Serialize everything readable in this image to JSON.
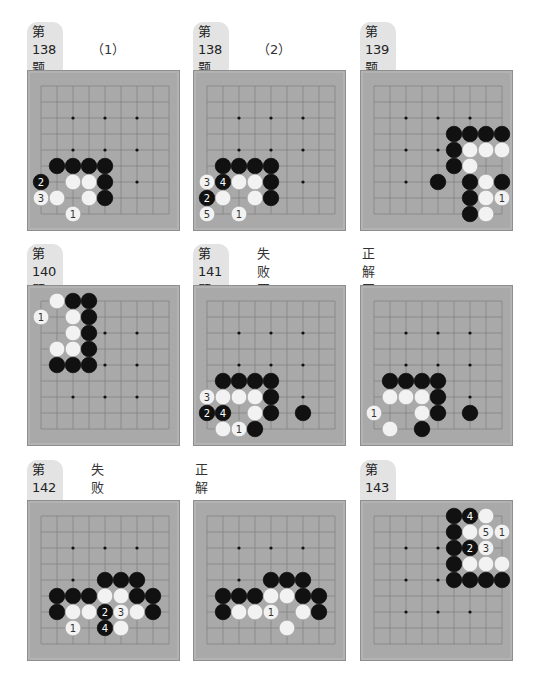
{
  "colors": {
    "board": "#a9a9a9",
    "grid_line": "#7a7a7a",
    "black_stone": "#111111",
    "white_stone": "#f2f2f2",
    "label_pill": "#e3e3e3"
  },
  "grid": {
    "size": 9,
    "spacing": 16,
    "origin_x": 13,
    "origin_y": 15
  },
  "problems": [
    {
      "id": "p138-1",
      "label": "第138题",
      "sub_label": "（1）",
      "pos": {
        "x": 27,
        "y": 40,
        "board_y": 70
      },
      "stars": [
        [
          2,
          2
        ],
        [
          4,
          2
        ],
        [
          6,
          2
        ],
        [
          2,
          4
        ],
        [
          4,
          4
        ],
        [
          6,
          4
        ],
        [
          6,
          6
        ]
      ],
      "stones": [
        {
          "c": "B",
          "x": 1,
          "y": 5
        },
        {
          "c": "B",
          "x": 2,
          "y": 5
        },
        {
          "c": "B",
          "x": 3,
          "y": 5
        },
        {
          "c": "B",
          "x": 4,
          "y": 5
        },
        {
          "c": "B",
          "x": 0,
          "y": 6,
          "n": "2"
        },
        {
          "c": "W",
          "x": 2,
          "y": 6
        },
        {
          "c": "W",
          "x": 3,
          "y": 6
        },
        {
          "c": "B",
          "x": 4,
          "y": 6
        },
        {
          "c": "W",
          "x": 0,
          "y": 7,
          "n": "3"
        },
        {
          "c": "W",
          "x": 1,
          "y": 7
        },
        {
          "c": "W",
          "x": 3,
          "y": 7
        },
        {
          "c": "B",
          "x": 4,
          "y": 7
        },
        {
          "c": "W",
          "x": 2,
          "y": 8,
          "n": "1"
        }
      ]
    },
    {
      "id": "p138-2",
      "label": "第138题",
      "sub_label": "（2）",
      "pos": {
        "x": 193,
        "y": 40,
        "board_y": 70
      },
      "stars": [
        [
          2,
          2
        ],
        [
          4,
          2
        ],
        [
          6,
          2
        ],
        [
          2,
          4
        ],
        [
          4,
          4
        ],
        [
          6,
          4
        ],
        [
          6,
          6
        ]
      ],
      "stones": [
        {
          "c": "B",
          "x": 1,
          "y": 5
        },
        {
          "c": "B",
          "x": 2,
          "y": 5
        },
        {
          "c": "B",
          "x": 3,
          "y": 5
        },
        {
          "c": "B",
          "x": 4,
          "y": 5
        },
        {
          "c": "W",
          "x": 0,
          "y": 6,
          "n": "3"
        },
        {
          "c": "B",
          "x": 1,
          "y": 6,
          "n": "4"
        },
        {
          "c": "W",
          "x": 2,
          "y": 6
        },
        {
          "c": "W",
          "x": 3,
          "y": 6
        },
        {
          "c": "B",
          "x": 4,
          "y": 6
        },
        {
          "c": "B",
          "x": 0,
          "y": 7,
          "n": "2"
        },
        {
          "c": "W",
          "x": 1,
          "y": 7
        },
        {
          "c": "W",
          "x": 3,
          "y": 7
        },
        {
          "c": "B",
          "x": 4,
          "y": 7
        },
        {
          "c": "W",
          "x": 0,
          "y": 8,
          "n": "5"
        },
        {
          "c": "W",
          "x": 2,
          "y": 8,
          "n": "1"
        }
      ]
    },
    {
      "id": "p139",
      "label": "第139题",
      "sub_label": "",
      "pos": {
        "x": 360,
        "y": 40,
        "board_y": 70
      },
      "stars": [
        [
          2,
          2
        ],
        [
          4,
          2
        ],
        [
          6,
          2
        ],
        [
          2,
          4
        ],
        [
          4,
          4
        ],
        [
          2,
          6
        ]
      ],
      "stones": [
        {
          "c": "B",
          "x": 5,
          "y": 3
        },
        {
          "c": "B",
          "x": 6,
          "y": 3
        },
        {
          "c": "B",
          "x": 7,
          "y": 3
        },
        {
          "c": "B",
          "x": 8,
          "y": 3
        },
        {
          "c": "B",
          "x": 5,
          "y": 4
        },
        {
          "c": "W",
          "x": 6,
          "y": 4
        },
        {
          "c": "W",
          "x": 7,
          "y": 4
        },
        {
          "c": "W",
          "x": 8,
          "y": 4
        },
        {
          "c": "B",
          "x": 5,
          "y": 5
        },
        {
          "c": "W",
          "x": 6,
          "y": 5
        },
        {
          "c": "B",
          "x": 4,
          "y": 6
        },
        {
          "c": "B",
          "x": 6,
          "y": 6
        },
        {
          "c": "W",
          "x": 7,
          "y": 6
        },
        {
          "c": "B",
          "x": 8,
          "y": 6
        },
        {
          "c": "B",
          "x": 6,
          "y": 7
        },
        {
          "c": "W",
          "x": 7,
          "y": 7
        },
        {
          "c": "W",
          "x": 8,
          "y": 7,
          "n": "1"
        },
        {
          "c": "B",
          "x": 6,
          "y": 8
        },
        {
          "c": "W",
          "x": 7,
          "y": 8
        }
      ]
    },
    {
      "id": "p140",
      "label": "第140题",
      "sub_label": "",
      "pos": {
        "x": 27,
        "y": 262,
        "board_y": 285
      },
      "stars": [
        [
          4,
          2
        ],
        [
          6,
          2
        ],
        [
          4,
          4
        ],
        [
          6,
          4
        ],
        [
          2,
          6
        ],
        [
          4,
          6
        ],
        [
          6,
          6
        ]
      ],
      "stones": [
        {
          "c": "W",
          "x": 1,
          "y": 0
        },
        {
          "c": "B",
          "x": 2,
          "y": 0
        },
        {
          "c": "B",
          "x": 3,
          "y": 0
        },
        {
          "c": "W",
          "x": 0,
          "y": 1,
          "n": "1"
        },
        {
          "c": "W",
          "x": 2,
          "y": 1
        },
        {
          "c": "B",
          "x": 3,
          "y": 1
        },
        {
          "c": "W",
          "x": 2,
          "y": 2
        },
        {
          "c": "B",
          "x": 3,
          "y": 2
        },
        {
          "c": "W",
          "x": 1,
          "y": 3
        },
        {
          "c": "W",
          "x": 2,
          "y": 3
        },
        {
          "c": "B",
          "x": 3,
          "y": 3
        },
        {
          "c": "B",
          "x": 1,
          "y": 4
        },
        {
          "c": "B",
          "x": 2,
          "y": 4
        },
        {
          "c": "B",
          "x": 3,
          "y": 4
        }
      ]
    },
    {
      "id": "p141-fail",
      "label": "第141题",
      "sub_label": "失败图",
      "pos": {
        "x": 193,
        "y": 262,
        "board_y": 285
      },
      "stars": [
        [
          2,
          2
        ],
        [
          4,
          2
        ],
        [
          6,
          2
        ],
        [
          2,
          4
        ],
        [
          4,
          4
        ],
        [
          6,
          4
        ],
        [
          6,
          6
        ]
      ],
      "stones": [
        {
          "c": "B",
          "x": 1,
          "y": 5
        },
        {
          "c": "B",
          "x": 2,
          "y": 5
        },
        {
          "c": "B",
          "x": 3,
          "y": 5
        },
        {
          "c": "B",
          "x": 4,
          "y": 5
        },
        {
          "c": "W",
          "x": 0,
          "y": 6,
          "n": "3"
        },
        {
          "c": "W",
          "x": 1,
          "y": 6
        },
        {
          "c": "W",
          "x": 2,
          "y": 6
        },
        {
          "c": "W",
          "x": 3,
          "y": 6
        },
        {
          "c": "B",
          "x": 4,
          "y": 6
        },
        {
          "c": "B",
          "x": 0,
          "y": 7,
          "n": "2"
        },
        {
          "c": "B",
          "x": 1,
          "y": 7,
          "n": "4"
        },
        {
          "c": "W",
          "x": 3,
          "y": 7
        },
        {
          "c": "B",
          "x": 4,
          "y": 7
        },
        {
          "c": "B",
          "x": 6,
          "y": 7
        },
        {
          "c": "W",
          "x": 1,
          "y": 8
        },
        {
          "c": "W",
          "x": 2,
          "y": 8,
          "n": "1"
        },
        {
          "c": "B",
          "x": 3,
          "y": 8
        }
      ]
    },
    {
      "id": "p141-correct",
      "label": "",
      "sub_label": "正解图",
      "pos": {
        "x": 360,
        "y": 262,
        "board_y": 285
      },
      "stars": [
        [
          2,
          2
        ],
        [
          4,
          2
        ],
        [
          6,
          2
        ],
        [
          2,
          4
        ],
        [
          4,
          4
        ],
        [
          6,
          4
        ],
        [
          6,
          6
        ]
      ],
      "stones": [
        {
          "c": "B",
          "x": 1,
          "y": 5
        },
        {
          "c": "B",
          "x": 2,
          "y": 5
        },
        {
          "c": "B",
          "x": 3,
          "y": 5
        },
        {
          "c": "B",
          "x": 4,
          "y": 5
        },
        {
          "c": "W",
          "x": 1,
          "y": 6
        },
        {
          "c": "W",
          "x": 2,
          "y": 6
        },
        {
          "c": "W",
          "x": 3,
          "y": 6
        },
        {
          "c": "B",
          "x": 4,
          "y": 6
        },
        {
          "c": "W",
          "x": 0,
          "y": 7,
          "n": "1"
        },
        {
          "c": "W",
          "x": 3,
          "y": 7
        },
        {
          "c": "B",
          "x": 4,
          "y": 7
        },
        {
          "c": "B",
          "x": 6,
          "y": 7
        },
        {
          "c": "W",
          "x": 1,
          "y": 8
        },
        {
          "c": "B",
          "x": 3,
          "y": 8
        }
      ]
    },
    {
      "id": "p142-fail",
      "label": "第142题",
      "sub_label": "失败图",
      "pos": {
        "x": 27,
        "y": 478,
        "board_y": 500
      },
      "stars": [
        [
          2,
          2
        ],
        [
          4,
          2
        ],
        [
          6,
          2
        ],
        [
          2,
          4
        ],
        [
          4,
          4
        ],
        [
          6,
          4
        ]
      ],
      "stones": [
        {
          "c": "B",
          "x": 4,
          "y": 4
        },
        {
          "c": "B",
          "x": 5,
          "y": 4
        },
        {
          "c": "B",
          "x": 6,
          "y": 4
        },
        {
          "c": "B",
          "x": 1,
          "y": 5
        },
        {
          "c": "B",
          "x": 2,
          "y": 5
        },
        {
          "c": "B",
          "x": 3,
          "y": 5
        },
        {
          "c": "W",
          "x": 4,
          "y": 5
        },
        {
          "c": "W",
          "x": 5,
          "y": 5
        },
        {
          "c": "B",
          "x": 6,
          "y": 5
        },
        {
          "c": "B",
          "x": 7,
          "y": 5
        },
        {
          "c": "B",
          "x": 1,
          "y": 6
        },
        {
          "c": "W",
          "x": 2,
          "y": 6
        },
        {
          "c": "W",
          "x": 3,
          "y": 6
        },
        {
          "c": "B",
          "x": 4,
          "y": 6,
          "n": "2"
        },
        {
          "c": "W",
          "x": 5,
          "y": 6,
          "n": "3"
        },
        {
          "c": "W",
          "x": 6,
          "y": 6
        },
        {
          "c": "B",
          "x": 7,
          "y": 6
        },
        {
          "c": "W",
          "x": 2,
          "y": 7,
          "n": "1"
        },
        {
          "c": "B",
          "x": 4,
          "y": 7,
          "n": "4"
        },
        {
          "c": "W",
          "x": 5,
          "y": 7
        }
      ]
    },
    {
      "id": "p142-correct",
      "label": "",
      "sub_label": "正解图",
      "pos": {
        "x": 193,
        "y": 478,
        "board_y": 500
      },
      "stars": [
        [
          2,
          2
        ],
        [
          4,
          2
        ],
        [
          6,
          2
        ],
        [
          2,
          4
        ],
        [
          4,
          4
        ],
        [
          6,
          4
        ]
      ],
      "stones": [
        {
          "c": "B",
          "x": 4,
          "y": 4
        },
        {
          "c": "B",
          "x": 5,
          "y": 4
        },
        {
          "c": "B",
          "x": 6,
          "y": 4
        },
        {
          "c": "B",
          "x": 1,
          "y": 5
        },
        {
          "c": "B",
          "x": 2,
          "y": 5
        },
        {
          "c": "B",
          "x": 3,
          "y": 5
        },
        {
          "c": "W",
          "x": 4,
          "y": 5
        },
        {
          "c": "W",
          "x": 5,
          "y": 5
        },
        {
          "c": "B",
          "x": 6,
          "y": 5
        },
        {
          "c": "B",
          "x": 7,
          "y": 5
        },
        {
          "c": "B",
          "x": 1,
          "y": 6
        },
        {
          "c": "W",
          "x": 2,
          "y": 6
        },
        {
          "c": "W",
          "x": 3,
          "y": 6
        },
        {
          "c": "W",
          "x": 4,
          "y": 6,
          "n": "1"
        },
        {
          "c": "W",
          "x": 6,
          "y": 6
        },
        {
          "c": "B",
          "x": 7,
          "y": 6
        },
        {
          "c": "W",
          "x": 5,
          "y": 7
        }
      ]
    },
    {
      "id": "p143",
      "label": "第143题",
      "sub_label": "",
      "pos": {
        "x": 360,
        "y": 478,
        "board_y": 500
      },
      "stars": [
        [
          2,
          2
        ],
        [
          4,
          2
        ],
        [
          2,
          4
        ],
        [
          4,
          4
        ],
        [
          2,
          6
        ],
        [
          4,
          6
        ],
        [
          6,
          6
        ]
      ],
      "stones": [
        {
          "c": "B",
          "x": 5,
          "y": 0
        },
        {
          "c": "B",
          "x": 6,
          "y": 0,
          "n": "4"
        },
        {
          "c": "W",
          "x": 7,
          "y": 0
        },
        {
          "c": "B",
          "x": 5,
          "y": 1
        },
        {
          "c": "W",
          "x": 6,
          "y": 1
        },
        {
          "c": "W",
          "x": 7,
          "y": 1,
          "n": "5"
        },
        {
          "c": "W",
          "x": 8,
          "y": 1,
          "n": "1"
        },
        {
          "c": "B",
          "x": 5,
          "y": 2
        },
        {
          "c": "B",
          "x": 6,
          "y": 2,
          "n": "2"
        },
        {
          "c": "W",
          "x": 7,
          "y": 2,
          "n": "3"
        },
        {
          "c": "B",
          "x": 5,
          "y": 3
        },
        {
          "c": "W",
          "x": 6,
          "y": 3
        },
        {
          "c": "W",
          "x": 7,
          "y": 3
        },
        {
          "c": "W",
          "x": 8,
          "y": 3
        },
        {
          "c": "B",
          "x": 5,
          "y": 4
        },
        {
          "c": "B",
          "x": 6,
          "y": 4
        },
        {
          "c": "B",
          "x": 7,
          "y": 4
        },
        {
          "c": "B",
          "x": 8,
          "y": 4
        }
      ]
    }
  ]
}
